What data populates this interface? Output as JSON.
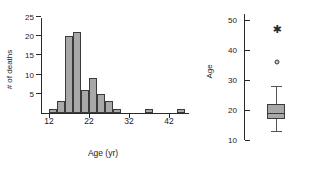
{
  "chart_data": [
    {
      "type": "bar",
      "panel": "left",
      "title": "",
      "xlabel": "Age (yr)",
      "ylabel": "# of deaths",
      "xlim": [
        10,
        47
      ],
      "ylim": [
        0,
        25
      ],
      "xticks": [
        12,
        22,
        32,
        42
      ],
      "yticks": [
        5,
        10,
        15,
        20,
        25
      ],
      "grid": false,
      "bin_width": 2,
      "bin_starts": [
        12,
        14,
        16,
        18,
        20,
        22,
        24,
        26,
        36,
        44
      ],
      "categories": [
        "12-14",
        "14-16",
        "16-18",
        "18-20",
        "20-22",
        "22-24",
        "24-26",
        "26-28",
        "36-38",
        "44-46"
      ],
      "values": [
        1,
        3,
        20,
        21,
        6,
        9,
        5,
        3,
        1,
        1
      ],
      "bars": [
        {
          "start": 12,
          "end": 14,
          "count": 1
        },
        {
          "start": 14,
          "end": 16,
          "count": 3
        },
        {
          "start": 16,
          "end": 18,
          "count": 20
        },
        {
          "start": 18,
          "end": 20,
          "count": 21
        },
        {
          "start": 20,
          "end": 22,
          "count": 6
        },
        {
          "start": 22,
          "end": 24,
          "count": 9
        },
        {
          "start": 24,
          "end": 26,
          "count": 5
        },
        {
          "start": 26,
          "end": 28,
          "count": 3
        },
        {
          "start": 28,
          "end": 30,
          "count": 1
        },
        {
          "start": 36,
          "end": 38,
          "count": 1
        },
        {
          "start": 44,
          "end": 46,
          "count": 1
        }
      ]
    },
    {
      "type": "boxplot",
      "panel": "right",
      "title": "",
      "xlabel": "",
      "ylabel": "Age",
      "ylim": [
        10,
        52
      ],
      "yticks": [
        10,
        20,
        30,
        40,
        50
      ],
      "grid": false,
      "boxes": [
        {
          "name": "Age",
          "min_whisker": 13,
          "q1": 17,
          "median": 19,
          "q3": 22,
          "max_whisker": 28,
          "outliers": [
            {
              "value": 36,
              "marker": "circle"
            },
            {
              "value": 47,
              "marker": "star"
            }
          ]
        }
      ]
    }
  ],
  "histogram": {
    "ylabel": "# of deaths",
    "xlabel": "Age (yr)",
    "ytick_labels": [
      "5",
      "10",
      "15",
      "20",
      "25"
    ],
    "xtick_labels": [
      "12",
      "22",
      "32",
      "42"
    ]
  },
  "boxplot": {
    "ylabel": "Age",
    "ytick_labels": [
      "10",
      "20",
      "30",
      "40",
      "50"
    ]
  },
  "colors": {
    "bar_fill": "#a8a8a8",
    "bar_stroke": "#3a3a3a",
    "axis": "#2a2a2a",
    "background": "#ffffff"
  }
}
